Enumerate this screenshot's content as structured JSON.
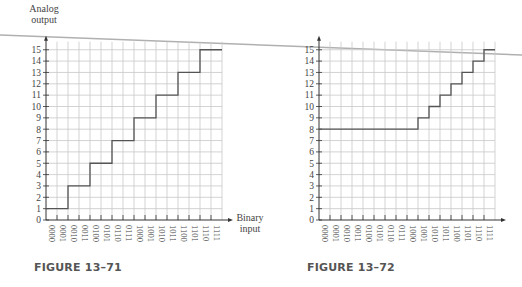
{
  "chart_data": [
    {
      "type": "line",
      "step": true,
      "title": "",
      "caption": "FIGURE 13–71",
      "ylabel_lines": [
        "Analog",
        "output"
      ],
      "xlabel_lines": [
        "Binary",
        "input"
      ],
      "categories": [
        "0000",
        "0001",
        "0010",
        "0011",
        "0100",
        "0101",
        "0110",
        "0111",
        "1000",
        "1001",
        "1010",
        "1011",
        "1100",
        "1101",
        "1110",
        "1111"
      ],
      "values": [
        1,
        1,
        3,
        3,
        5,
        5,
        7,
        7,
        9,
        9,
        11,
        11,
        13,
        13,
        15,
        15
      ],
      "yticks": [
        0,
        1,
        2,
        3,
        4,
        5,
        6,
        7,
        8,
        9,
        10,
        11,
        12,
        13,
        14,
        15
      ],
      "ylim": [
        0,
        15
      ],
      "grid": true
    },
    {
      "type": "line",
      "step": true,
      "title": "",
      "caption": "FIGURE 13–72",
      "ylabel_lines": [],
      "xlabel_lines": [],
      "categories": [
        "0000",
        "0001",
        "0010",
        "0011",
        "0100",
        "0101",
        "0110",
        "0111",
        "1000",
        "1001",
        "1010",
        "1011",
        "1100",
        "1101",
        "1110",
        "1111"
      ],
      "values": [
        8,
        8,
        8,
        8,
        8,
        8,
        8,
        8,
        8,
        9,
        10,
        11,
        12,
        13,
        14,
        15
      ],
      "yticks": [
        0,
        1,
        2,
        3,
        4,
        5,
        6,
        7,
        8,
        9,
        10,
        11,
        12,
        13,
        14,
        15
      ],
      "ylim": [
        0,
        15
      ],
      "grid": true
    }
  ],
  "colors": {
    "grid": "#c8c8c8",
    "axis": "#333333",
    "staircase": "#555555",
    "scan_line": "#b0b0b0"
  }
}
